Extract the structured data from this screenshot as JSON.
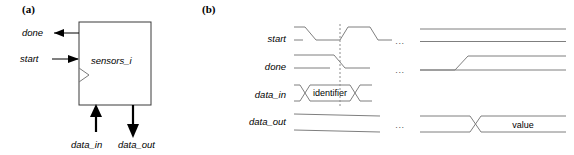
{
  "figure": {
    "panels": [
      {
        "tag": "(a)",
        "caption_x": 22,
        "caption_y": 13
      },
      {
        "tag": "(b)",
        "caption_x": 202,
        "caption_y": 13
      }
    ]
  },
  "block_diagram": {
    "module_name": "sensors_i",
    "ports": [
      {
        "name": "done",
        "direction": "output",
        "side": "left"
      },
      {
        "name": "start",
        "direction": "input",
        "side": "left"
      },
      {
        "name": "clk",
        "direction": "input",
        "side": "left",
        "glyph": "clock-triangle"
      },
      {
        "name": "data_in",
        "direction": "input",
        "side": "bottom"
      },
      {
        "name": "data_out",
        "direction": "output",
        "side": "bottom"
      }
    ],
    "labels": {
      "done": "done",
      "start": "start",
      "data_in": "data_in",
      "data_out": "data_out"
    }
  },
  "timing_diagram": {
    "signals": [
      {
        "name": "start",
        "label": "start",
        "type": "logic"
      },
      {
        "name": "done",
        "label": "done",
        "type": "logic"
      },
      {
        "name": "data_in",
        "label": "data_in",
        "type": "bus"
      },
      {
        "name": "data_out",
        "label": "data_out",
        "type": "bus"
      }
    ],
    "bus_values": {
      "data_in": "identifier",
      "data_out": "value"
    },
    "ellipsis": "...",
    "ellipsis_rows": [
      "start",
      "done",
      "data_out"
    ],
    "marker": {
      "type": "dashed-vertical",
      "spans": [
        "start",
        "done",
        "data_in"
      ]
    }
  },
  "colors": {
    "background": "#ffffff",
    "ink": "#000000",
    "wave": "#7f7f7f",
    "box_outline": "#3a3a3a",
    "marker": "#8c8c8c",
    "ellipsis": "#555555"
  }
}
